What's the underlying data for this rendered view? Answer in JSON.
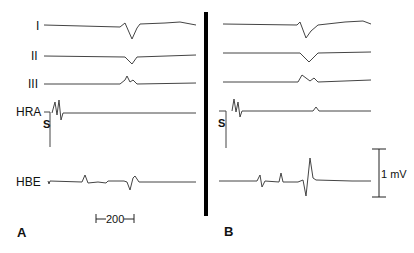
{
  "figure": {
    "leads": [
      "I",
      "II",
      "III",
      "HRA",
      "HBE"
    ],
    "stimulus_label": "S",
    "panels": [
      {
        "label": "A"
      },
      {
        "label": "B"
      }
    ],
    "time_scale": {
      "label": "200"
    },
    "voltage_scale": {
      "label": "1 mV"
    }
  },
  "colors": {
    "trace": "#444444",
    "divider": "#000000"
  }
}
